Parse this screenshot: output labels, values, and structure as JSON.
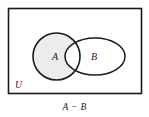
{
  "figure": {
    "type": "venn-diagram",
    "caption": "A − B",
    "universe_label": "U",
    "sets": [
      {
        "name": "A",
        "label": "A",
        "shape": "circle",
        "shaded": true,
        "fill_color": "#ececec",
        "stroke_color": "#1a1a1a"
      },
      {
        "name": "B",
        "label": "B",
        "shape": "ellipse",
        "shaded": false,
        "fill_color": "#ffffff",
        "stroke_color": "#1a1a1a"
      }
    ],
    "region_shaded_description": "A minus B",
    "colors": {
      "background": "#ffffff",
      "outline": "#1a1a1a",
      "shade": "#ececec",
      "universe_border": "#1a1a1a"
    }
  }
}
